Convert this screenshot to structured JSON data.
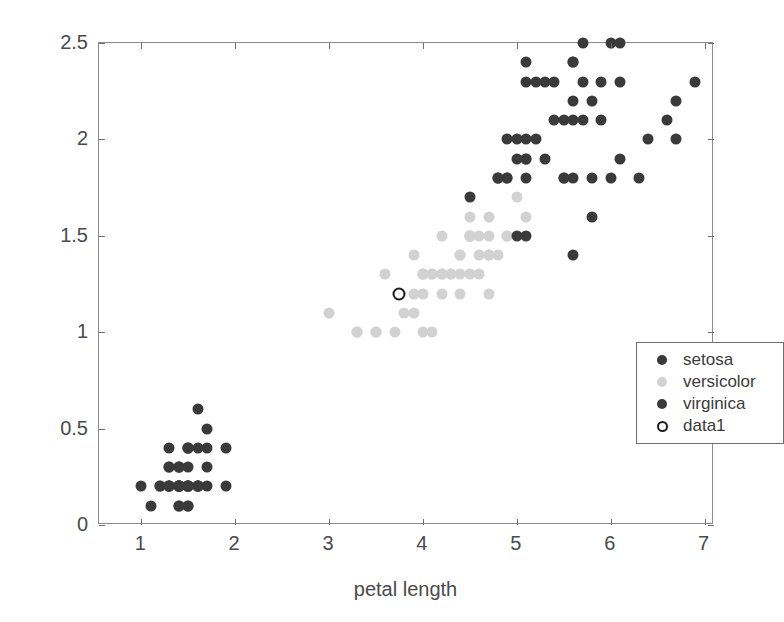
{
  "chart_data": {
    "type": "scatter",
    "title": "",
    "xlabel": "petal length",
    "ylabel": "petal width",
    "xlim": [
      0.55,
      7.1
    ],
    "ylim": [
      0.0,
      2.5
    ],
    "xticks": [
      1,
      2,
      3,
      4,
      5,
      6,
      7
    ],
    "xticklabels": [
      "1",
      "2",
      "3",
      "4",
      "5",
      "6",
      "7"
    ],
    "yticks": [
      0,
      0.5,
      1,
      1.5,
      2,
      2.5
    ],
    "yticklabels": [
      "0",
      "0.5",
      "1",
      "1.5",
      "2",
      "2.5"
    ],
    "grid": false,
    "legend_position": "center-right",
    "series": [
      {
        "name": "setosa",
        "color": "#3a3a3a",
        "marker": "filled-circle",
        "points": [
          [
            1.4,
            0.2
          ],
          [
            1.4,
            0.2
          ],
          [
            1.3,
            0.2
          ],
          [
            1.5,
            0.2
          ],
          [
            1.4,
            0.2
          ],
          [
            1.7,
            0.4
          ],
          [
            1.4,
            0.3
          ],
          [
            1.5,
            0.2
          ],
          [
            1.4,
            0.2
          ],
          [
            1.5,
            0.1
          ],
          [
            1.5,
            0.2
          ],
          [
            1.6,
            0.2
          ],
          [
            1.4,
            0.1
          ],
          [
            1.1,
            0.1
          ],
          [
            1.2,
            0.2
          ],
          [
            1.5,
            0.4
          ],
          [
            1.3,
            0.4
          ],
          [
            1.4,
            0.3
          ],
          [
            1.7,
            0.3
          ],
          [
            1.5,
            0.3
          ],
          [
            1.7,
            0.2
          ],
          [
            1.5,
            0.4
          ],
          [
            1.0,
            0.2
          ],
          [
            1.7,
            0.5
          ],
          [
            1.9,
            0.2
          ],
          [
            1.6,
            0.2
          ],
          [
            1.6,
            0.4
          ],
          [
            1.5,
            0.2
          ],
          [
            1.4,
            0.2
          ],
          [
            1.6,
            0.2
          ],
          [
            1.6,
            0.2
          ],
          [
            1.5,
            0.4
          ],
          [
            1.5,
            0.1
          ],
          [
            1.4,
            0.2
          ],
          [
            1.5,
            0.2
          ],
          [
            1.2,
            0.2
          ],
          [
            1.3,
            0.2
          ],
          [
            1.4,
            0.1
          ],
          [
            1.3,
            0.2
          ],
          [
            1.5,
            0.2
          ],
          [
            1.3,
            0.3
          ],
          [
            1.3,
            0.3
          ],
          [
            1.3,
            0.2
          ],
          [
            1.6,
            0.6
          ],
          [
            1.9,
            0.4
          ],
          [
            1.4,
            0.3
          ],
          [
            1.6,
            0.2
          ],
          [
            1.4,
            0.2
          ],
          [
            1.5,
            0.2
          ],
          [
            1.4,
            0.2
          ]
        ]
      },
      {
        "name": "versicolor",
        "color": "#d2d2d2",
        "marker": "filled-circle",
        "points": [
          [
            4.7,
            1.4
          ],
          [
            4.5,
            1.5
          ],
          [
            4.9,
            1.5
          ],
          [
            4.0,
            1.3
          ],
          [
            4.6,
            1.5
          ],
          [
            4.5,
            1.3
          ],
          [
            4.7,
            1.6
          ],
          [
            3.3,
            1.0
          ],
          [
            4.6,
            1.3
          ],
          [
            3.9,
            1.4
          ],
          [
            3.5,
            1.0
          ],
          [
            4.2,
            1.5
          ],
          [
            4.0,
            1.0
          ],
          [
            4.7,
            1.4
          ],
          [
            3.6,
            1.3
          ],
          [
            4.4,
            1.4
          ],
          [
            4.5,
            1.5
          ],
          [
            4.1,
            1.0
          ],
          [
            4.5,
            1.5
          ],
          [
            3.9,
            1.1
          ],
          [
            4.8,
            1.8
          ],
          [
            4.0,
            1.3
          ],
          [
            4.9,
            1.5
          ],
          [
            4.7,
            1.2
          ],
          [
            4.3,
            1.3
          ],
          [
            4.4,
            1.4
          ],
          [
            4.8,
            1.4
          ],
          [
            5.0,
            1.7
          ],
          [
            4.5,
            1.5
          ],
          [
            3.5,
            1.0
          ],
          [
            3.8,
            1.1
          ],
          [
            3.7,
            1.0
          ],
          [
            3.9,
            1.2
          ],
          [
            5.1,
            1.6
          ],
          [
            4.5,
            1.5
          ],
          [
            4.5,
            1.6
          ],
          [
            4.7,
            1.5
          ],
          [
            4.4,
            1.3
          ],
          [
            4.1,
            1.3
          ],
          [
            4.0,
            1.3
          ],
          [
            4.4,
            1.2
          ],
          [
            4.6,
            1.4
          ],
          [
            4.0,
            1.2
          ],
          [
            3.3,
            1.0
          ],
          [
            4.2,
            1.3
          ],
          [
            4.2,
            1.2
          ],
          [
            4.2,
            1.3
          ],
          [
            4.3,
            1.3
          ],
          [
            3.0,
            1.1
          ],
          [
            4.1,
            1.3
          ]
        ]
      },
      {
        "name": "virginica",
        "color": "#3a3a3a",
        "marker": "filled-circle",
        "points": [
          [
            6.0,
            2.5
          ],
          [
            5.1,
            1.9
          ],
          [
            5.9,
            2.1
          ],
          [
            5.6,
            1.8
          ],
          [
            5.8,
            2.2
          ],
          [
            6.6,
            2.1
          ],
          [
            4.5,
            1.7
          ],
          [
            6.3,
            1.8
          ],
          [
            5.8,
            1.8
          ],
          [
            6.1,
            2.5
          ],
          [
            5.1,
            2.0
          ],
          [
            5.3,
            1.9
          ],
          [
            5.5,
            2.1
          ],
          [
            5.0,
            2.0
          ],
          [
            5.1,
            2.4
          ],
          [
            5.3,
            2.3
          ],
          [
            5.5,
            1.8
          ],
          [
            6.7,
            2.2
          ],
          [
            6.9,
            2.3
          ],
          [
            5.0,
            1.5
          ],
          [
            5.7,
            2.3
          ],
          [
            4.9,
            2.0
          ],
          [
            6.7,
            2.0
          ],
          [
            4.9,
            1.8
          ],
          [
            5.7,
            2.1
          ],
          [
            6.0,
            1.8
          ],
          [
            4.8,
            1.8
          ],
          [
            4.9,
            1.8
          ],
          [
            5.6,
            2.1
          ],
          [
            5.8,
            1.6
          ],
          [
            6.1,
            1.9
          ],
          [
            6.4,
            2.0
          ],
          [
            5.6,
            2.2
          ],
          [
            5.1,
            1.5
          ],
          [
            5.6,
            1.4
          ],
          [
            6.1,
            2.3
          ],
          [
            5.6,
            2.4
          ],
          [
            5.5,
            1.8
          ],
          [
            4.8,
            1.8
          ],
          [
            5.4,
            2.1
          ],
          [
            5.6,
            2.4
          ],
          [
            5.1,
            2.3
          ],
          [
            5.1,
            1.9
          ],
          [
            5.9,
            2.3
          ],
          [
            5.7,
            2.5
          ],
          [
            5.2,
            2.3
          ],
          [
            5.0,
            1.9
          ],
          [
            5.2,
            2.0
          ],
          [
            5.4,
            2.3
          ],
          [
            5.1,
            1.8
          ]
        ]
      },
      {
        "name": "data1",
        "color": "#1c1c1c",
        "marker": "open-circle",
        "points": [
          [
            3.75,
            1.2
          ]
        ]
      }
    ]
  },
  "axes": {
    "xlabel": "petal length",
    "ylabel": "petal width"
  },
  "legend": {
    "items": [
      {
        "label": "setosa",
        "marker": "filled-circle",
        "color": "#3a3a3a"
      },
      {
        "label": "versicolor",
        "marker": "filled-circle",
        "color": "#d2d2d2"
      },
      {
        "label": "virginica",
        "marker": "filled-circle",
        "color": "#3a3a3a"
      },
      {
        "label": "data1",
        "marker": "open-circle",
        "color": "#1c1c1c"
      }
    ]
  }
}
